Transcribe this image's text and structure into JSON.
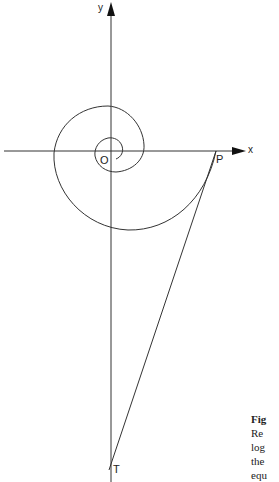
{
  "figure": {
    "axis_labels": {
      "x": "x",
      "y": "y"
    },
    "point_labels": {
      "origin": "O",
      "p": "P",
      "t": "T"
    },
    "caption_lines": [
      "Fig",
      "Re",
      "log",
      "the",
      "equ"
    ]
  }
}
